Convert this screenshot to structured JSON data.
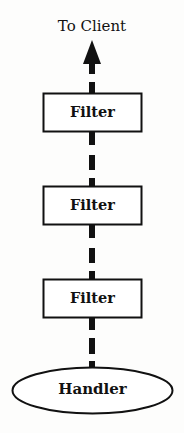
{
  "diagram": {
    "top_label": "To Client",
    "filters": [
      {
        "label": "Filter"
      },
      {
        "label": "Filter"
      },
      {
        "label": "Filter"
      }
    ],
    "handler": {
      "label": "Handler"
    },
    "flow_direction": "up",
    "connector_style": "dashed-thick",
    "colors": {
      "stroke": "#111111",
      "background": "#fdfdfc"
    }
  }
}
